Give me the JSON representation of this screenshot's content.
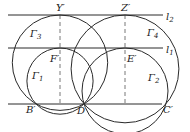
{
  "diagram": {
    "stroke_color": "#2a2a2a",
    "dash_color": "#555555",
    "lines": [
      {
        "name": "l2",
        "label": "l",
        "sub": "2",
        "y": 15,
        "x1": 8,
        "x2": 163
      },
      {
        "name": "l1",
        "label": "l",
        "sub": "1",
        "y": 48,
        "x1": 8,
        "x2": 163
      },
      {
        "name": "base",
        "label": "",
        "sub": "",
        "y": 104,
        "x1": 8,
        "x2": 162
      }
    ],
    "points": [
      {
        "name": "Y'",
        "label": "Y′",
        "x": 60,
        "y": 15
      },
      {
        "name": "Z'",
        "label": "Z′",
        "x": 125,
        "y": 15
      },
      {
        "name": "F'",
        "label": "F′",
        "x": 60,
        "y": 48
      },
      {
        "name": "E'",
        "label": "E′",
        "x": 125,
        "y": 48
      },
      {
        "name": "B'",
        "label": "B′",
        "x": 36,
        "y": 104
      },
      {
        "name": "D",
        "label": "D",
        "x": 84,
        "y": 104
      },
      {
        "name": "C'",
        "label": "C′",
        "x": 162,
        "y": 104
      }
    ],
    "circles": [
      {
        "name": "Gamma1",
        "label": "Γ",
        "sub": "1",
        "cx": 60,
        "cy": 81.1,
        "r": 33.1
      },
      {
        "name": "Gamma2",
        "label": "Γ",
        "sub": "2",
        "cx": 125,
        "cy": 91,
        "r": 43
      },
      {
        "name": "Gamma3",
        "label": "Γ",
        "sub": "3",
        "cx": 60,
        "cy": 62.7,
        "r": 47.7
      },
      {
        "name": "Gamma4",
        "label": "Γ",
        "sub": "4",
        "cx": 125,
        "cy": 68.9,
        "r": 53.9
      }
    ],
    "labels": {
      "Y": "Y′",
      "Z": "Z′",
      "F": "F′",
      "E": "E′",
      "B": "B′",
      "D": "D",
      "C": "C′",
      "l1": "l",
      "l1_sub": "1",
      "l2": "l",
      "l2_sub": "2",
      "g1": "Γ",
      "g1_sub": "1",
      "g2": "Γ",
      "g2_sub": "2",
      "g3": "Γ",
      "g3_sub": "3",
      "g4": "Γ",
      "g4_sub": "4"
    }
  }
}
